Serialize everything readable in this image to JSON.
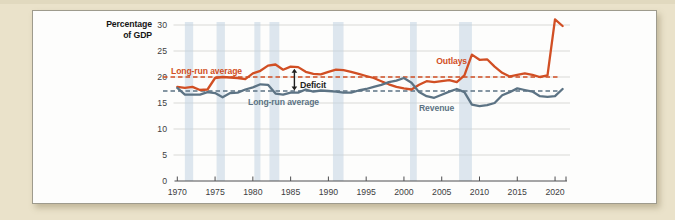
{
  "page": {
    "background_color": "#eae2ca",
    "top_edge_color": "#d9d1b6"
  },
  "card": {
    "background_color": "#fdfdfc",
    "border_color": "#9e9b8d"
  },
  "chart_data": {
    "type": "line",
    "y_axis_title_lines": [
      "Percentage",
      "of GDP"
    ],
    "y_label": "Percentage of GDP",
    "x_label": "",
    "grid": true,
    "xlim": [
      1969.6,
      2021.6
    ],
    "ylim": [
      0,
      30
    ],
    "x_ticks": [
      1970,
      1975,
      1980,
      1985,
      1990,
      1995,
      2000,
      2005,
      2010,
      2015,
      2020
    ],
    "y_ticks": [
      0,
      5,
      10,
      15,
      20,
      25,
      30
    ],
    "x": [
      1970,
      1971,
      1972,
      1973,
      1974,
      1975,
      1976,
      1977,
      1978,
      1979,
      1980,
      1981,
      1982,
      1983,
      1984,
      1985,
      1986,
      1987,
      1988,
      1989,
      1990,
      1991,
      1992,
      1993,
      1994,
      1995,
      1996,
      1997,
      1998,
      1999,
      2000,
      2001,
      2002,
      2003,
      2004,
      2005,
      2006,
      2007,
      2008,
      2009,
      2010,
      2011,
      2012,
      2013,
      2014,
      2015,
      2016,
      2017,
      2018,
      2019,
      2020,
      2021
    ],
    "series": [
      {
        "name": "Outlays",
        "label": "Outlays",
        "color": "#d14f24",
        "values": [
          18.1,
          17.9,
          18.1,
          17.5,
          17.6,
          19.8,
          20.0,
          19.9,
          19.8,
          19.6,
          20.7,
          21.2,
          22.2,
          22.4,
          21.4,
          22.0,
          21.9,
          21.0,
          20.6,
          20.5,
          21.0,
          21.4,
          21.3,
          21.0,
          20.6,
          20.2,
          19.8,
          19.2,
          18.6,
          18.1,
          17.8,
          17.6,
          18.5,
          19.2,
          19.0,
          19.2,
          19.4,
          19.0,
          20.3,
          24.3,
          23.3,
          23.4,
          22.0,
          20.8,
          20.1,
          20.4,
          20.7,
          20.4,
          20.0,
          20.3,
          31.1,
          29.8
        ]
      },
      {
        "name": "Revenue",
        "label": "Revenue",
        "color": "#5c7384",
        "values": [
          17.9,
          16.6,
          16.6,
          16.6,
          17.1,
          16.9,
          16.1,
          16.9,
          17.0,
          17.6,
          18.0,
          18.6,
          18.5,
          16.8,
          16.6,
          17.0,
          17.0,
          17.6,
          17.2,
          17.4,
          17.3,
          17.2,
          17.0,
          17.0,
          17.4,
          17.7,
          18.1,
          18.5,
          19.0,
          19.3,
          19.8,
          18.9,
          17.1,
          16.3,
          16.0,
          16.6,
          17.2,
          17.7,
          17.1,
          14.7,
          14.4,
          14.6,
          15.0,
          16.5,
          17.1,
          17.8,
          17.5,
          17.2,
          16.3,
          16.2,
          16.3,
          17.7
        ]
      }
    ],
    "reference_lines": [
      {
        "name": "outlays-long-run-average",
        "label": "Long-run average",
        "value": 20.0,
        "color": "#d14f24",
        "style": "dashed"
      },
      {
        "name": "revenue-long-run-average",
        "label": "Long-run average",
        "value": 17.3,
        "color": "#5c7384",
        "style": "dashed"
      }
    ],
    "recession_bands": {
      "color": "#c3d3e2",
      "ranges": [
        [
          1971.0,
          1972.1
        ],
        [
          1975.2,
          1976.3
        ],
        [
          1980.2,
          1981.0
        ],
        [
          1982.2,
          1983.5
        ],
        [
          1990.6,
          1992.0
        ],
        [
          2000.8,
          2001.7
        ],
        [
          2007.3,
          2009.0
        ]
      ]
    },
    "annotations": {
      "deficit": {
        "label": "Deficit",
        "x": 1985.5,
        "from": 17.4,
        "to": 21.6,
        "color": "#1f1f1f"
      }
    },
    "axis_colors": {
      "grid": "#d9d9d6",
      "axis": "#4e4e50",
      "tick_text": "#3d3d3f"
    }
  }
}
